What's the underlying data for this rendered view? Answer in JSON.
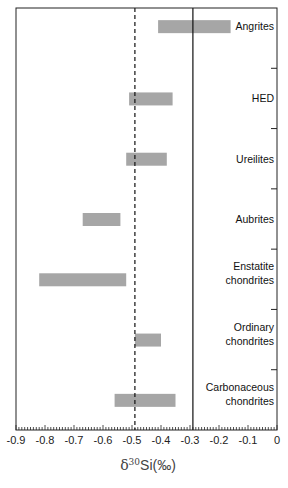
{
  "chart_data": {
    "type": "bar",
    "orientation": "horizontal-range",
    "title": "",
    "xlabel": "δ30Si(‰)",
    "ylabel": "",
    "xlim": [
      -0.9,
      0
    ],
    "xticks": [
      "-0.9",
      "-0.8",
      "-0.7",
      "-0.6",
      "-0.5",
      "-0.4",
      "-0.3",
      "-0.2",
      "-0.1",
      "0"
    ],
    "categories": [
      "Angrites",
      "HED",
      "Ureilites",
      "Aubrites",
      "Enstatite chondrites",
      "Ordinary chondrites",
      "Carbonaceous chondrites"
    ],
    "ranges": [
      [
        -0.41,
        -0.16
      ],
      [
        -0.51,
        -0.36
      ],
      [
        -0.52,
        -0.38
      ],
      [
        -0.67,
        -0.54
      ],
      [
        -0.82,
        -0.52
      ],
      [
        -0.49,
        -0.4
      ],
      [
        -0.56,
        -0.35
      ]
    ],
    "reference_lines": [
      {
        "x": -0.49,
        "style": "dashed"
      },
      {
        "x": -0.29,
        "style": "solid"
      }
    ],
    "bar_color": "#a6a6a6",
    "grid": false
  }
}
